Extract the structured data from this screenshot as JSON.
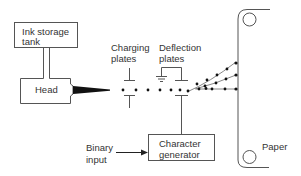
{
  "diagram": {
    "colors": {
      "stroke": "#555555",
      "text": "#333333",
      "ink": "#111111",
      "background": "#ffffff"
    },
    "blocks": {
      "ink_tank": {
        "line1": "Ink storage",
        "line2": "tank"
      },
      "head": {
        "label": "Head"
      },
      "charging_plates": {
        "line1": "Charging",
        "line2": "plates"
      },
      "deflection_plates": {
        "line1": "Deflection",
        "line2": "plates"
      },
      "character_generator": {
        "line1": "Character",
        "line2": "generator"
      },
      "binary_input": {
        "line1": "Binary",
        "line2": "input"
      },
      "paper": {
        "label": "Paper"
      }
    },
    "icons": [
      "ground-symbol",
      "ink-jet-stream",
      "ink-droplets",
      "paper-roller-top",
      "paper-roller-bottom",
      "arrow-right"
    ]
  }
}
